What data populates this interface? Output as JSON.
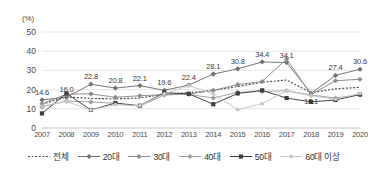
{
  "chart_data": {
    "type": "line",
    "title": "",
    "subtitle": "",
    "xlabel": "",
    "ylabel": "",
    "unit_label": "(%)",
    "grid": true,
    "legend_position": "bottom",
    "ylim": [
      0,
      50
    ],
    "yticks": [
      0,
      10,
      20,
      30,
      40,
      50
    ],
    "categories": [
      "2007",
      "2008",
      "2009",
      "2010",
      "2011",
      "2012",
      "2013",
      "2014",
      "2015",
      "2016",
      "2017",
      "2018",
      "2019",
      "2020"
    ],
    "series": [
      {
        "name": "전체",
        "style": "dotted",
        "marker": "none",
        "color": "#4a4a4a",
        "values": [
          12.4,
          16.2,
          15.4,
          15.2,
          15.6,
          17.6,
          18.4,
          19.6,
          21.6,
          23.8,
          25.0,
          18.4,
          20.4,
          21.2
        ]
      },
      {
        "name": "20대",
        "style": "solid",
        "marker": "diamond",
        "color": "#6f6f6f",
        "values": [
          14.6,
          16.0,
          22.8,
          20.8,
          22.1,
          19.6,
          22.4,
          28.1,
          30.8,
          34.4,
          34.1,
          18.1,
          27.4,
          30.6
        ]
      },
      {
        "name": "30대",
        "style": "solid",
        "marker": "diamond",
        "color": "#8a8a8a",
        "values": [
          12.6,
          17.6,
          17.8,
          16.0,
          16.8,
          17.4,
          17.6,
          19.6,
          22.6,
          24.2,
          36.0,
          17.4,
          24.6,
          25.4
        ]
      },
      {
        "name": "40대",
        "style": "solid",
        "marker": "diamond",
        "color": "#9e9e9e",
        "values": [
          11.0,
          14.0,
          13.6,
          12.8,
          11.4,
          17.2,
          17.6,
          15.6,
          18.6,
          19.0,
          19.4,
          17.2,
          15.6,
          17.4
        ]
      },
      {
        "name": "50대",
        "style": "solid",
        "marker": "square",
        "color": "#3d3d3d",
        "values": [
          7.6,
          18.0,
          9.4,
          13.0,
          11.6,
          18.4,
          17.8,
          12.4,
          18.0,
          19.6,
          15.6,
          13.6,
          14.6,
          17.4
        ]
      },
      {
        "name": "60대 이상",
        "style": "solid",
        "marker": "dot",
        "color": "#c6c6c6",
        "values": [
          11.4,
          13.8,
          9.4,
          12.2,
          11.6,
          17.8,
          22.0,
          17.8,
          9.6,
          12.6,
          19.4,
          16.8,
          15.0,
          18.0
        ]
      }
    ],
    "data_labels": {
      "series": "20대",
      "values": [
        "14.6",
        "16.0",
        "22.8",
        "20.8",
        "22.1",
        "19.6",
        "22.4",
        "28.1",
        "30.8",
        "34.4",
        "34.1",
        "18.1",
        "27.4",
        "30.6"
      ]
    }
  }
}
